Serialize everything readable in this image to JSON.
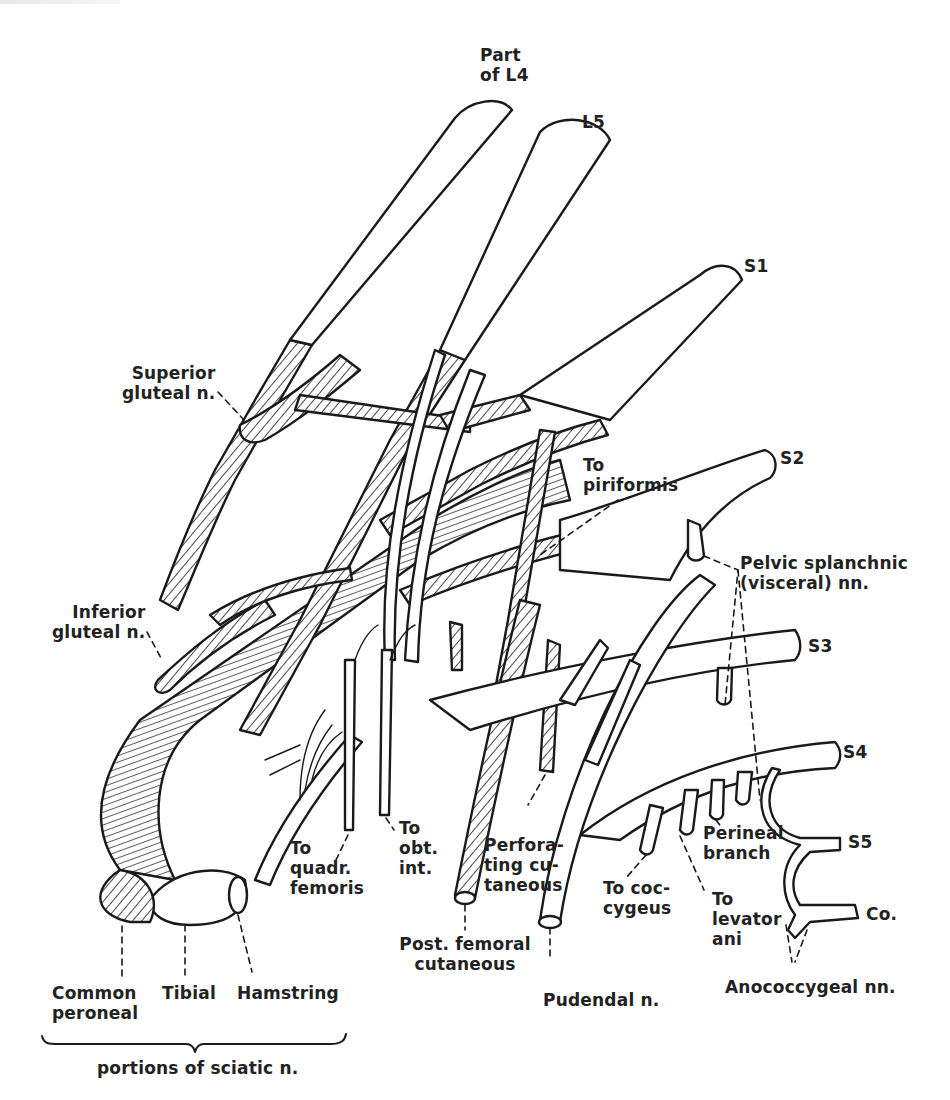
{
  "figure": {
    "type": "anatomical line drawing",
    "ink_color": "#1a1a1a",
    "background_color": "#ffffff",
    "hatch_meaning": "dorsal (posterior) division components"
  },
  "roots": [
    {
      "id": "l4",
      "label": "Part\nof L4",
      "x": 480,
      "y": 45
    },
    {
      "id": "l5",
      "label": "L5",
      "x": 582,
      "y": 112
    },
    {
      "id": "s1",
      "label": "S1",
      "x": 744,
      "y": 256
    },
    {
      "id": "s2",
      "label": "S2",
      "x": 780,
      "y": 448
    },
    {
      "id": "s3",
      "label": "S3",
      "x": 808,
      "y": 636
    },
    {
      "id": "s4",
      "label": "S4",
      "x": 843,
      "y": 742
    },
    {
      "id": "s5",
      "label": "S5",
      "x": 848,
      "y": 832
    },
    {
      "id": "co",
      "label": "Co.",
      "x": 866,
      "y": 904
    }
  ],
  "branch_labels": [
    {
      "id": "superior-gluteal",
      "label": "Superior\ngluteal n.",
      "x": 122,
      "y": 363
    },
    {
      "id": "inferior-gluteal",
      "label": "Inferior\ngluteal n.",
      "x": 52,
      "y": 602
    },
    {
      "id": "to-piriformis",
      "label": "To\npiriformis",
      "x": 583,
      "y": 455
    },
    {
      "id": "pelvic-splanchnic",
      "label": "Pelvic splanchnic\n(visceral) nn.",
      "x": 740,
      "y": 553
    },
    {
      "id": "to-quadr-femoris",
      "label": "To\nquadr.\nfemoris",
      "x": 290,
      "y": 838
    },
    {
      "id": "to-obt-int",
      "label": "To\nobt.\nint.",
      "x": 399,
      "y": 818
    },
    {
      "id": "post-femoral-cutaneous",
      "label": "Post. femoral\ncutaneous",
      "x": 365,
      "y": 926,
      "center": true
    },
    {
      "id": "perforating-cutaneous",
      "label": "Perfora-\nting cu-\ntaneous",
      "x": 484,
      "y": 835
    },
    {
      "id": "pudendal",
      "label": "Pudendal n.",
      "x": 543,
      "y": 990
    },
    {
      "id": "to-coccygeus",
      "label": "To coc-\ncygeus",
      "x": 603,
      "y": 878
    },
    {
      "id": "perineal-branch",
      "label": "Perineal\nbranch",
      "x": 703,
      "y": 823
    },
    {
      "id": "to-levator-ani",
      "label": "To\nlevator\nani",
      "x": 712,
      "y": 889
    },
    {
      "id": "anococcygeal",
      "label": "Anococcygeal nn.",
      "x": 725,
      "y": 977
    }
  ],
  "sciatic_portions": {
    "items": [
      {
        "id": "common-peroneal",
        "label": "Common\nperoneal",
        "x": 52,
        "y": 983
      },
      {
        "id": "tibial",
        "label": "Tibial",
        "x": 162,
        "y": 983
      },
      {
        "id": "hamstring",
        "label": "Hamstring",
        "x": 237,
        "y": 983
      }
    ],
    "group_label": "portions of sciatic n.",
    "group_label_x": 97,
    "group_label_y": 1058
  }
}
